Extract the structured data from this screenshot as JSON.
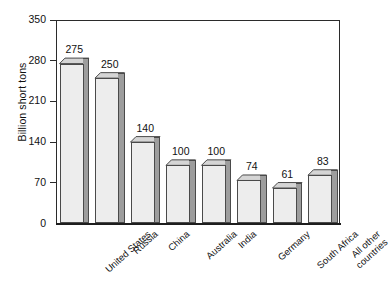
{
  "chart_data": {
    "type": "bar",
    "title": "",
    "subtitle": "",
    "xlabel": "",
    "ylabel": "Billion short tons",
    "categories": [
      "United States",
      "Russia",
      "China",
      "Australia",
      "India",
      "Germany",
      "South Africa",
      "All other countries"
    ],
    "values": [
      275,
      250,
      140,
      100,
      100,
      74,
      61,
      83
    ],
    "data_labels": [
      "275",
      "250",
      "140",
      "100",
      "100",
      "74",
      "61",
      "83"
    ],
    "ylim": [
      0,
      350
    ],
    "yticks": [
      0,
      70,
      140,
      210,
      280,
      350
    ],
    "ytick_labels": [
      "0",
      "70",
      "140",
      "210",
      "280",
      "350"
    ],
    "grid": false,
    "legend": false,
    "legend_position": "none",
    "style": "3d-extruded-bars",
    "colors": {
      "bar_face": "#ededed",
      "bar_side": "#9d9d9d",
      "bar_top": "#d5d5d5",
      "bar_outline": "#4a4a4a",
      "axis": "#2b2b2b",
      "text": "#111111",
      "background": "#ffffff"
    }
  },
  "axis": {
    "y_title": "Billion short tons"
  },
  "category_label_lines": [
    [
      "United States"
    ],
    [
      "Russia"
    ],
    [
      "China"
    ],
    [
      "Australia"
    ],
    [
      "India"
    ],
    [
      "Germany"
    ],
    [
      "South Africa"
    ],
    [
      "All other",
      "countries"
    ]
  ]
}
